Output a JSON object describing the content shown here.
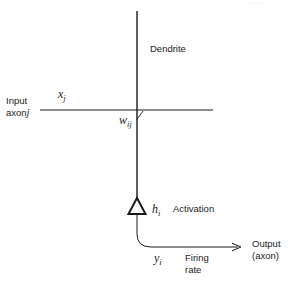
{
  "figure": {
    "watermark": "neuron"
  },
  "labels": {
    "dendrite": "Dendrite",
    "input_line1": "Input",
    "input_line2_text": "axon",
    "input_line2_index": "j",
    "activation": "Activation",
    "firing_line1": "Firing",
    "firing_line2": "rate",
    "output_line1": "Output",
    "output_line2": "(axon)"
  },
  "math": {
    "x_symbol": "x",
    "x_subscript": "j",
    "w_symbol": "w",
    "w_subscript": "ij",
    "h_symbol": "h",
    "h_subscript": "i",
    "y_symbol": "y",
    "y_subscript": "i"
  },
  "colors": {
    "stroke": "#1a1a1a",
    "text": "#1a1a1a",
    "background": "#ffffff"
  }
}
